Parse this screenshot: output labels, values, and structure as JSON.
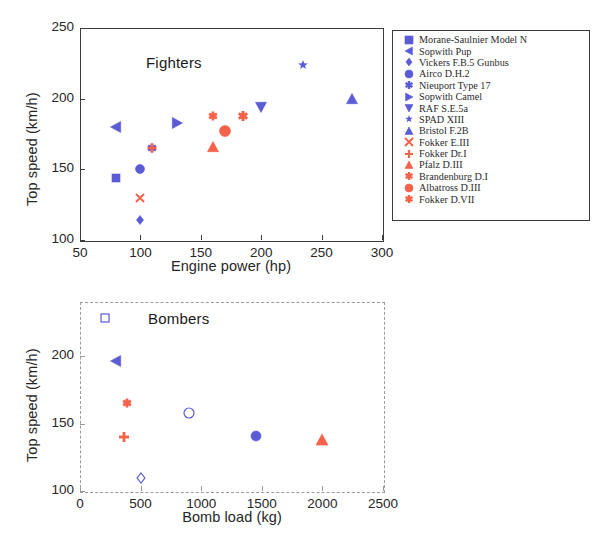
{
  "colors": {
    "blue": "#5b5bd6",
    "red": "#f4624a",
    "axis": "#3c3c3c",
    "axis_dashed": "#9a9a9a",
    "text": "#262626"
  },
  "chart_data": [
    {
      "type": "scatter",
      "title": "Fighters",
      "xlabel": "Engine power (hp)",
      "ylabel": "Top speed (km/h)",
      "xlim": [
        50,
        300
      ],
      "ylim": [
        100,
        250
      ],
      "xticks": [
        50,
        100,
        150,
        200,
        250,
        300
      ],
      "yticks": [
        100,
        150,
        200,
        250
      ],
      "grid": false,
      "legend_position": "right-outside",
      "series": [
        {
          "name": "Morane-Saulnier Model N",
          "marker": "square",
          "color": "#5b5bd6",
          "size": 8,
          "x": 80,
          "y": 144
        },
        {
          "name": "Sopwith Pup",
          "marker": "triangle-left",
          "color": "#5b5bd6",
          "size": 11,
          "x": 80,
          "y": 180
        },
        {
          "name": "Vickers F.B.5 Gunbus",
          "marker": "diamond",
          "color": "#5b5bd6",
          "size": 9,
          "x": 100,
          "y": 114
        },
        {
          "name": "Airco D.H.2",
          "marker": "circle",
          "color": "#5b5bd6",
          "size": 9,
          "x": 100,
          "y": 150
        },
        {
          "name": "Nieuport Type 17",
          "marker": "asterisk",
          "color": "#5b5bd6",
          "size": 9,
          "x": 110,
          "y": 165
        },
        {
          "name": "Sopwith Camel",
          "marker": "triangle-right",
          "color": "#5b5bd6",
          "size": 11,
          "x": 130,
          "y": 183
        },
        {
          "name": "RAF S.E.5a",
          "marker": "triangle-down",
          "color": "#5b5bd6",
          "size": 11,
          "x": 200,
          "y": 194
        },
        {
          "name": "SPAD XIII",
          "marker": "star",
          "color": "#5b5bd6",
          "size": 10,
          "x": 235,
          "y": 224
        },
        {
          "name": "Bristol F.2B",
          "marker": "triangle-up",
          "color": "#5b5bd6",
          "size": 11,
          "x": 275,
          "y": 200
        },
        {
          "name": "Fokker E.III",
          "marker": "cross",
          "color": "#f4624a",
          "size": 8,
          "x": 100,
          "y": 130
        },
        {
          "name": "Fokker Dr.I",
          "marker": "plus",
          "color": "#f4624a",
          "size": 9,
          "x": 110,
          "y": 165
        },
        {
          "name": "Pfalz D.III",
          "marker": "triangle-up",
          "color": "#f4624a",
          "size": 11,
          "x": 160,
          "y": 166
        },
        {
          "name": "Brandenburg D.I",
          "marker": "asterisk",
          "color": "#f4624a",
          "size": 9,
          "x": 160,
          "y": 188
        },
        {
          "name": "Albatross D.III",
          "marker": "circle",
          "color": "#f4624a",
          "size": 11,
          "x": 170,
          "y": 177
        },
        {
          "name": "Fokker D.VII",
          "marker": "asterisk",
          "color": "#f4624a",
          "size": 10,
          "x": 185,
          "y": 188
        }
      ]
    },
    {
      "type": "scatter",
      "title": "Bombers",
      "xlabel": "Bomb load (kg)",
      "ylabel": "Top speed (km/h)",
      "xlim": [
        0,
        2500
      ],
      "ylim": [
        100,
        240
      ],
      "xticks": [
        0,
        500,
        1000,
        1500,
        2000,
        2500
      ],
      "yticks": [
        100,
        150,
        200
      ],
      "grid": false,
      "legend_position": "right-outside",
      "series": [
        {
          "name": "Airco DH.4",
          "marker": "square-open",
          "color": "#5b5bd6",
          "size": 8,
          "x": 209,
          "y": 228
        },
        {
          "name": "Bréguet 14 B.2",
          "marker": "triangle-left",
          "color": "#5b5bd6",
          "size": 11,
          "x": 300,
          "y": 196
        },
        {
          "name": "Sikorsky Ilya Muromets S-23 V",
          "marker": "diamond-open",
          "color": "#5b5bd6",
          "size": 10,
          "x": 500,
          "y": 110
        },
        {
          "name": "Handley Page Type O/400",
          "marker": "circle-open",
          "color": "#5b5bd6",
          "size": 10,
          "x": 900,
          "y": 158
        },
        {
          "name": "Caproni Ca.4",
          "marker": "circle",
          "color": "#5b5bd6",
          "size": 10,
          "x": 1450,
          "y": 141
        },
        {
          "name": "AEG G.IV",
          "marker": "asterisk",
          "color": "#f4624a",
          "size": 9,
          "x": 390,
          "y": 165
        },
        {
          "name": "Gotha G. V",
          "marker": "plus",
          "color": "#f4624a",
          "size": 10,
          "x": 360,
          "y": 140
        },
        {
          "name": "Zeppelin-Staaken R.V",
          "marker": "triangle-up",
          "color": "#f4624a",
          "size": 12,
          "x": 2000,
          "y": 138
        }
      ]
    }
  ]
}
